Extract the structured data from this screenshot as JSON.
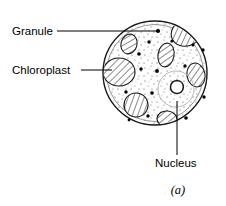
{
  "figure": {
    "title_caption": "(a)",
    "background_color": "#ffffff",
    "outline_color": "#1a1a1a"
  },
  "labels": [
    {
      "id": "granule",
      "text": "Granule",
      "text_x": 12,
      "text_y": 35,
      "leader": "M57,31 L158,31",
      "anchor": "start"
    },
    {
      "id": "chloroplast",
      "text": "Chloroplast",
      "text_x": 12,
      "text_y": 74,
      "leader": "M81,70 L112,70",
      "anchor": "start"
    },
    {
      "id": "nucleus",
      "text": "Nucleus",
      "text_x": 155,
      "text_y": 167,
      "leader": "M177,101 L177,155",
      "anchor": "start"
    }
  ],
  "cell": {
    "center_x": 155,
    "center_y": 73,
    "radius": 52,
    "fill_color": "#ffffff",
    "stroke_color": "#1a1a1a"
  },
  "nucleus": {
    "halo_center_x": 176,
    "halo_center_y": 89,
    "halo_radius": 18,
    "body_center_x": 177,
    "body_center_y": 87,
    "body_radius": 6.5
  },
  "chloroplasts": [
    {
      "id": "chloroplast-top-right",
      "cx": 186,
      "cy": 33,
      "rx": 15,
      "ry": 13,
      "rot": -20
    },
    {
      "id": "chloroplast-upper-left",
      "cx": 129,
      "cy": 44,
      "rx": 8,
      "ry": 10,
      "rot": 15
    },
    {
      "id": "chloroplast-left",
      "cx": 119,
      "cy": 72,
      "rx": 16,
      "ry": 14,
      "rot": 0
    },
    {
      "id": "chloroplast-center",
      "cx": 166,
      "cy": 55,
      "rx": 8,
      "ry": 12,
      "rot": 10
    },
    {
      "id": "chloroplast-right",
      "cx": 196,
      "cy": 75,
      "rx": 9,
      "ry": 12,
      "rot": -10
    },
    {
      "id": "chloroplast-lower-left",
      "cx": 136,
      "cy": 105,
      "rx": 12,
      "ry": 12,
      "rot": -25
    },
    {
      "id": "chloroplast-bottom",
      "cx": 167,
      "cy": 119,
      "rx": 10,
      "ry": 8,
      "rot": 5
    }
  ],
  "granules": [
    {
      "id": "granule-1",
      "cx": 158,
      "cy": 31,
      "r": 2.1
    },
    {
      "id": "granule-2",
      "cx": 149,
      "cy": 42,
      "r": 1.7
    },
    {
      "id": "granule-3",
      "cx": 172,
      "cy": 41,
      "r": 1.6
    },
    {
      "id": "granule-4",
      "cx": 139,
      "cy": 54,
      "r": 1.8
    },
    {
      "id": "granule-5",
      "cx": 203,
      "cy": 50,
      "r": 1.7
    },
    {
      "id": "granule-6",
      "cx": 141,
      "cy": 69,
      "r": 1.7
    },
    {
      "id": "granule-7",
      "cx": 157,
      "cy": 71,
      "r": 1.9
    },
    {
      "id": "granule-8",
      "cx": 185,
      "cy": 66,
      "r": 1.7
    },
    {
      "id": "granule-9",
      "cx": 126,
      "cy": 92,
      "r": 1.7
    },
    {
      "id": "granule-10",
      "cx": 152,
      "cy": 93,
      "r": 1.8
    },
    {
      "id": "granule-11",
      "cx": 204,
      "cy": 97,
      "r": 1.7
    },
    {
      "id": "granule-12",
      "cx": 148,
      "cy": 116,
      "r": 1.7
    },
    {
      "id": "granule-13",
      "cx": 186,
      "cy": 118,
      "r": 1.8
    },
    {
      "id": "granule-14",
      "cx": 193,
      "cy": 45,
      "r": 1.5
    },
    {
      "id": "granule-15",
      "cx": 129,
      "cy": 120,
      "r": 1.4
    }
  ],
  "colors": {
    "ink": "#1a1a1a",
    "hatch": "#333333",
    "stipple": "#555555",
    "halo": "#b9b9b9"
  }
}
